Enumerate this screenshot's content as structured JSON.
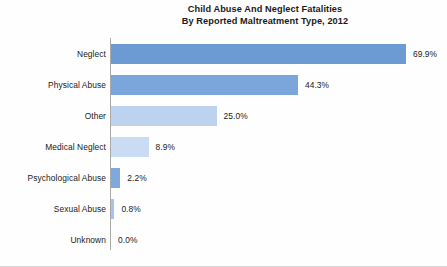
{
  "chart_data": {
    "type": "bar",
    "orientation": "horizontal",
    "title": "Child Abuse And Neglect Fatalities By Reported Maltreatment Type, 2012",
    "title_lines": [
      "Child Abuse And Neglect Fatalities",
      "By Reported Maltreatment Type, 2012"
    ],
    "xlabel": "",
    "ylabel": "",
    "xlim": [
      0,
      69.9
    ],
    "grid": false,
    "legend": "none",
    "categories": [
      "Neglect",
      "Physical Abuse",
      "Other",
      "Medical Neglect",
      "Psychological Abuse",
      "Sexual Abuse",
      "Unknown"
    ],
    "values": [
      69.9,
      44.3,
      25.0,
      8.9,
      2.2,
      0.8,
      0.0
    ],
    "value_labels": [
      "69.9%",
      "44.3%",
      "25.0%",
      "8.9%",
      "2.2%",
      "0.8%",
      "0.0%"
    ],
    "bar_colors": [
      "#6c9bd4",
      "#7ba6db",
      "#bcd2ee",
      "#cadcf4",
      "#7fa9dd",
      "#a8c4e8",
      "#cfdff2"
    ],
    "axis_color": "#a9a9a9",
    "text_color": "#212121",
    "background": "#fefefe"
  }
}
